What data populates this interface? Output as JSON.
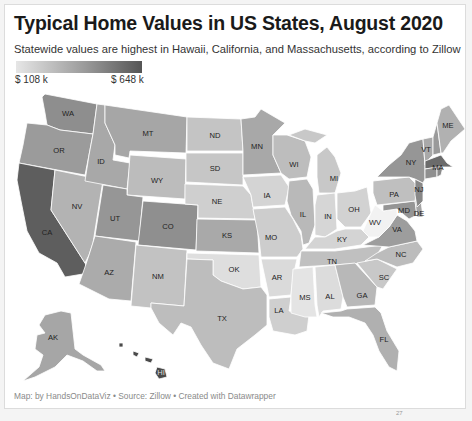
{
  "header": {
    "title": "Typical Home Values in US States, August 2020",
    "subtitle": "Statewide values are highest in Hawaii, California, and Massachusetts, according to Zillow"
  },
  "legend": {
    "min_label": "$ 108 k",
    "max_label": "$ 648 k",
    "min_color": "#e6e6e6",
    "max_color": "#555555"
  },
  "footer": {
    "credit": "Map: by HandsOnDataViz • Source: Zillow • Created with Datawrapper"
  },
  "page_marker": "27",
  "states": [
    {
      "id": "WA",
      "label": "WA",
      "fill": "#8e8e8e"
    },
    {
      "id": "OR",
      "label": "OR",
      "fill": "#9b9b9b"
    },
    {
      "id": "CA",
      "label": "CA",
      "fill": "#5e5e5e"
    },
    {
      "id": "NV",
      "label": "NV",
      "fill": "#b3b3b3"
    },
    {
      "id": "ID",
      "label": "ID",
      "fill": "#a8a8a8"
    },
    {
      "id": "MT",
      "label": "MT",
      "fill": "#a6a6a6"
    },
    {
      "id": "WY",
      "label": "WY",
      "fill": "#bcbcbc"
    },
    {
      "id": "UT",
      "label": "UT",
      "fill": "#969696"
    },
    {
      "id": "CO",
      "label": "CO",
      "fill": "#8f8f8f"
    },
    {
      "id": "AZ",
      "label": "AZ",
      "fill": "#ababab"
    },
    {
      "id": "NM",
      "label": "NM",
      "fill": "#c2c2c2"
    },
    {
      "id": "ND",
      "label": "ND",
      "fill": "#c4c4c4"
    },
    {
      "id": "SD",
      "label": "SD",
      "fill": "#c6c6c6"
    },
    {
      "id": "NE",
      "label": "NE",
      "fill": "#cfcfcf"
    },
    {
      "id": "KS",
      "label": "KS",
      "fill": "#a9a9a9"
    },
    {
      "id": "OK",
      "label": "OK",
      "fill": "#dedede"
    },
    {
      "id": "TX",
      "label": "TX",
      "fill": "#bdbdbd"
    },
    {
      "id": "MN",
      "label": "MN",
      "fill": "#a8a8a8"
    },
    {
      "id": "IA",
      "label": "IA",
      "fill": "#d4d4d4"
    },
    {
      "id": "MO",
      "label": "MO",
      "fill": "#cdcdcd"
    },
    {
      "id": "AR",
      "label": "AR",
      "fill": "#dadada"
    },
    {
      "id": "LA",
      "label": "LA",
      "fill": "#cfcfcf"
    },
    {
      "id": "WI",
      "label": "WI",
      "fill": "#bdbdbd"
    },
    {
      "id": "IL",
      "label": "IL",
      "fill": "#b9b9b9"
    },
    {
      "id": "MI",
      "label": "MI",
      "fill": "#c8c8c8"
    },
    {
      "id": "IN",
      "label": "IN",
      "fill": "#d6d6d6"
    },
    {
      "id": "OH",
      "label": "OH",
      "fill": "#d2d2d2"
    },
    {
      "id": "KY",
      "label": "KY",
      "fill": "#d4d4d4"
    },
    {
      "id": "TN",
      "label": "TN",
      "fill": "#c0c0c0"
    },
    {
      "id": "MS",
      "label": "MS",
      "fill": "#e4e4e4"
    },
    {
      "id": "AL",
      "label": "AL",
      "fill": "#dcdcdc"
    },
    {
      "id": "GA",
      "label": "GA",
      "fill": "#b8b8b8"
    },
    {
      "id": "FL",
      "label": "FL",
      "fill": "#b0b0b0"
    },
    {
      "id": "SC",
      "label": "SC",
      "fill": "#c8c8c8"
    },
    {
      "id": "NC",
      "label": "NC",
      "fill": "#bcbcbc"
    },
    {
      "id": "VA",
      "label": "VA",
      "fill": "#9d9d9d"
    },
    {
      "id": "WV",
      "label": "WV",
      "fill": "#f2f2f2"
    },
    {
      "id": "MD",
      "label": "MD",
      "fill": "#959595"
    },
    {
      "id": "DE",
      "label": "DE",
      "fill": "#a4a4a4"
    },
    {
      "id": "PA",
      "label": "PA",
      "fill": "#bfbfbf"
    },
    {
      "id": "NJ",
      "label": "NJ",
      "fill": "#888888"
    },
    {
      "id": "NY",
      "label": "NY",
      "fill": "#969696"
    },
    {
      "id": "VT",
      "label": "VT",
      "fill": "#a9a9a9"
    },
    {
      "id": "NH",
      "label": "",
      "fill": "#9a9a9a"
    },
    {
      "id": "MA",
      "label": "MA",
      "fill": "#6b6b6b"
    },
    {
      "id": "CT",
      "label": "",
      "fill": "#8f8f8f"
    },
    {
      "id": "RI",
      "label": "",
      "fill": "#8a8a8a"
    },
    {
      "id": "ME",
      "label": "ME",
      "fill": "#b1b1b1"
    },
    {
      "id": "AK",
      "label": "AK",
      "fill": "#a6a6a6"
    },
    {
      "id": "HI",
      "label": "HI",
      "fill": "#4a4a4a"
    }
  ]
}
